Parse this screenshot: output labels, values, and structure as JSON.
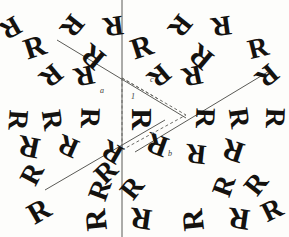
{
  "figure": {
    "background_color": "#fdfdfb",
    "ink_color": "#14120f",
    "line_color": "#5a5a56",
    "dash_color": "#6b6b66",
    "width": 289,
    "height": 237,
    "motif_glyph": "R",
    "lattice_type": "hexagonal",
    "rotation_order": 6
  },
  "cell_labels": [
    {
      "id": "label-a",
      "text": "a",
      "x": 100,
      "y": 87
    },
    {
      "id": "label-c",
      "text": "c",
      "x": 150,
      "y": 76
    },
    {
      "id": "label-1",
      "text": "1",
      "x": 131,
      "y": 93
    },
    {
      "id": "label-b",
      "text": "b",
      "x": 168,
      "y": 150
    }
  ],
  "axis_lines": [
    {
      "id": "vertical-axis",
      "x1": 122,
      "y1": 0,
      "x2": 122,
      "y2": 237
    },
    {
      "id": "diagonal-axis-upper-left",
      "x1": 57,
      "y1": 40,
      "x2": 186,
      "y2": 118
    },
    {
      "id": "diagonal-axis-upper-right",
      "x1": 271,
      "y1": 70,
      "x2": 135,
      "y2": 152
    },
    {
      "id": "diagonal-axis-lower-left",
      "x1": 45,
      "y1": 190,
      "x2": 165,
      "y2": 120
    }
  ],
  "cell_outline": [
    {
      "id": "cell-edge-left",
      "x1": 122,
      "y1": 78,
      "x2": 122,
      "y2": 150
    },
    {
      "id": "cell-edge-top",
      "x1": 122,
      "y1": 78,
      "x2": 186,
      "y2": 115
    },
    {
      "id": "cell-edge-bottom",
      "x1": 122,
      "y1": 150,
      "x2": 186,
      "y2": 115
    },
    {
      "id": "cell-diagonal-inner",
      "x1": 122,
      "y1": 78,
      "x2": 160,
      "y2": 100
    }
  ],
  "motifs": [
    {
      "id": "m01",
      "x": 24,
      "y": 32,
      "size": 30,
      "rot": -18
    },
    {
      "id": "m02",
      "x": 62,
      "y": 12,
      "size": 28,
      "rot": 128
    },
    {
      "id": "m03",
      "x": 103,
      "y": 12,
      "size": 28,
      "rot": 172
    },
    {
      "id": "m04",
      "x": 82,
      "y": 42,
      "size": 30,
      "rot": -140
    },
    {
      "id": "m05",
      "x": 41,
      "y": 62,
      "size": 28,
      "rot": 140
    },
    {
      "id": "m06",
      "x": 74,
      "y": 62,
      "size": 28,
      "rot": 168
    },
    {
      "id": "m07",
      "x": 131,
      "y": 32,
      "size": 30,
      "rot": -18
    },
    {
      "id": "m08",
      "x": 170,
      "y": 12,
      "size": 28,
      "rot": 128
    },
    {
      "id": "m09",
      "x": 211,
      "y": 12,
      "size": 28,
      "rot": 172
    },
    {
      "id": "m10",
      "x": 190,
      "y": 42,
      "size": 30,
      "rot": -140
    },
    {
      "id": "m11",
      "x": 149,
      "y": 62,
      "size": 28,
      "rot": 140
    },
    {
      "id": "m12",
      "x": 182,
      "y": 62,
      "size": 28,
      "rot": 168
    },
    {
      "id": "m13",
      "x": 248,
      "y": 34,
      "size": 28,
      "rot": -14
    },
    {
      "id": "m14",
      "x": 257,
      "y": 62,
      "size": 28,
      "rot": 140
    },
    {
      "id": "m15",
      "x": 8,
      "y": 106,
      "size": 28,
      "rot": 94
    },
    {
      "id": "m16",
      "x": 42,
      "y": 106,
      "size": 28,
      "rot": 82
    },
    {
      "id": "m17",
      "x": 80,
      "y": 104,
      "size": 28,
      "rot": 92
    },
    {
      "id": "m18",
      "x": 131,
      "y": 104,
      "size": 30,
      "rot": 90
    },
    {
      "id": "m19",
      "x": 146,
      "y": 130,
      "size": 30,
      "rot": 200
    },
    {
      "id": "m20",
      "x": 195,
      "y": 104,
      "size": 28,
      "rot": 92
    },
    {
      "id": "m21",
      "x": 229,
      "y": 104,
      "size": 28,
      "rot": 82
    },
    {
      "id": "m22",
      "x": 265,
      "y": 104,
      "size": 28,
      "rot": 92
    },
    {
      "id": "m23",
      "x": 18,
      "y": 132,
      "size": 30,
      "rot": 192
    },
    {
      "id": "m24",
      "x": 58,
      "y": 132,
      "size": 28,
      "rot": 204
    },
    {
      "id": "m25",
      "x": 22,
      "y": 160,
      "size": 28,
      "rot": -62
    },
    {
      "id": "m26",
      "x": 96,
      "y": 158,
      "size": 28,
      "rot": -44
    },
    {
      "id": "m27",
      "x": 102,
      "y": 138,
      "size": 28,
      "rot": 210
    },
    {
      "id": "m28",
      "x": 222,
      "y": 136,
      "size": 30,
      "rot": 198
    },
    {
      "id": "m29",
      "x": 186,
      "y": 140,
      "size": 28,
      "rot": 186
    },
    {
      "id": "m30",
      "x": 90,
      "y": 176,
      "size": 28,
      "rot": -70
    },
    {
      "id": "m31",
      "x": 122,
      "y": 174,
      "size": 28,
      "rot": -52
    },
    {
      "id": "m32",
      "x": 214,
      "y": 172,
      "size": 28,
      "rot": -70
    },
    {
      "id": "m33",
      "x": 246,
      "y": 170,
      "size": 28,
      "rot": -52
    },
    {
      "id": "m34",
      "x": 28,
      "y": 196,
      "size": 30,
      "rot": -30
    },
    {
      "id": "m35",
      "x": 85,
      "y": 205,
      "size": 30,
      "rot": -96
    },
    {
      "id": "m36",
      "x": 130,
      "y": 204,
      "size": 30,
      "rot": -172
    },
    {
      "id": "m37",
      "x": 182,
      "y": 205,
      "size": 30,
      "rot": -96
    },
    {
      "id": "m38",
      "x": 228,
      "y": 204,
      "size": 30,
      "rot": -172
    },
    {
      "id": "m39",
      "x": 0,
      "y": 14,
      "size": 28,
      "rot": 150
    },
    {
      "id": "m40",
      "x": 262,
      "y": 196,
      "size": 28,
      "rot": -26
    }
  ]
}
